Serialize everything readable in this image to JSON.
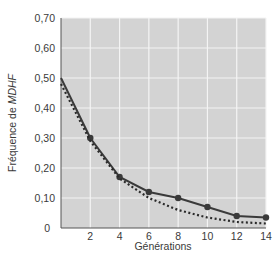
{
  "chart_data": {
    "type": "line",
    "title": "",
    "xlabel": "Générations",
    "ylabel_prefix": "Fréquence de ",
    "ylabel_italic": "MDHF",
    "x": [
      0,
      2,
      4,
      6,
      8,
      10,
      12,
      14
    ],
    "xticks": [
      "2",
      "4",
      "6",
      "8",
      "10",
      "12",
      "14"
    ],
    "yticks": [
      "0",
      "0,10",
      "0,20",
      "0,30",
      "0,40",
      "0,50",
      "0,60",
      "0,70"
    ],
    "xlim": [
      0,
      14
    ],
    "ylim": [
      0,
      0.7
    ],
    "grid": true,
    "series": [
      {
        "name": "observed",
        "style": "solid-with-markers",
        "color": "#3a3a3a",
        "values": [
          0.5,
          0.3,
          0.17,
          0.12,
          0.1,
          0.07,
          0.04,
          0.035
        ]
      },
      {
        "name": "theoretical",
        "style": "dotted",
        "color": "#2a2a2a",
        "values": [
          0.48,
          0.29,
          0.165,
          0.1,
          0.06,
          0.035,
          0.02,
          0.015
        ]
      }
    ]
  },
  "colors": {
    "plot_bg": "#d3d3d3",
    "grid": "#f4f4f4",
    "axis": "#555555"
  }
}
